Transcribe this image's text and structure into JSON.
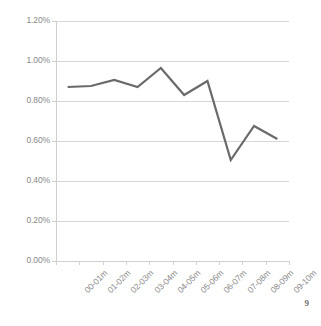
{
  "page": {
    "page_number": "9"
  },
  "chart_data": {
    "type": "line",
    "title": "",
    "subtitle": "",
    "xlabel": "",
    "ylabel": "",
    "categories": [
      "00-01m",
      "01-02m",
      "02-03m",
      "03-04m",
      "04-05m",
      "05-06m",
      "06-07m",
      "07-08m",
      "08-09m",
      "09-10m"
    ],
    "values": [
      0.87,
      0.875,
      0.905,
      0.87,
      0.965,
      0.83,
      0.9,
      0.505,
      0.675,
      0.61
    ],
    "series": [
      {
        "name": "",
        "values": [
          0.87,
          0.875,
          0.905,
          0.87,
          0.965,
          0.83,
          0.9,
          0.505,
          0.675,
          0.61
        ]
      }
    ],
    "value_unit": "%",
    "ylim": [
      0,
      1.2
    ],
    "ytick_values": [
      0,
      0.2,
      0.4,
      0.6,
      0.8,
      1.0,
      1.2
    ],
    "ytick_labels": [
      "0.00%",
      "0.20%",
      "0.40%",
      "0.60%",
      "0.80%",
      "1.00%",
      "1.20%"
    ],
    "grid": true,
    "grid_axis": "y",
    "legend": false,
    "legend_position": "none",
    "xtick_label_rotation": -45,
    "colors": {
      "series_line": "#6a6a6a",
      "gridline": "#d7d7d7",
      "axis": "#cfcfcf",
      "tick_text": "#888888",
      "background": "#ffffff"
    },
    "line_width": 2.2,
    "markers": false
  }
}
